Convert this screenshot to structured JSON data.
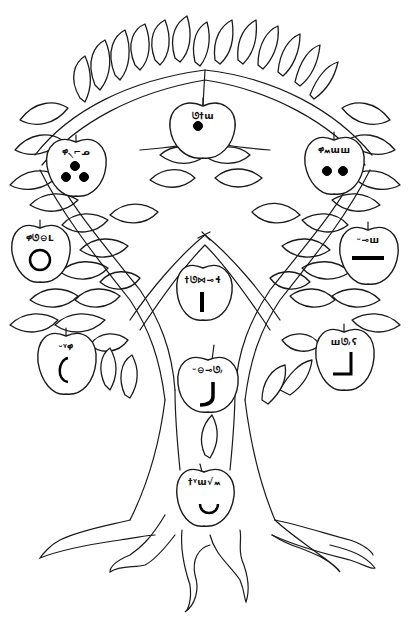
{
  "illustration": {
    "subject": "tree with labeled apples",
    "style": "black line art on white",
    "colors": {
      "line": "#1a1a1a",
      "background": "#ffffff",
      "symbol": "#000000"
    }
  },
  "apples": [
    {
      "id": "top-center",
      "label": "ᘎ†ɯ",
      "symbol": "one-dot"
    },
    {
      "id": "upper-left",
      "label": "ዋ৲⌐ᓄ",
      "symbol": "three-dots"
    },
    {
      "id": "upper-right",
      "label": "ዋ៳ɯш",
      "symbol": "two-dots"
    },
    {
      "id": "mid-left",
      "label": "ዋᘎ⊖ᒪ",
      "symbol": "circle"
    },
    {
      "id": "mid-right",
      "label": "ᵕ⊸ш",
      "symbol": "horizontal-line"
    },
    {
      "id": "center-upper",
      "label": "†ᘎ⋈⊸ɬ",
      "symbol": "vertical-line"
    },
    {
      "id": "lower-left",
      "label": "ᵕᵞዋ",
      "symbol": "left-arc"
    },
    {
      "id": "lower-right",
      "label": "шᘎ៸ʕ",
      "symbol": "corner-line"
    },
    {
      "id": "center-middle",
      "label": "ᵕ⊖⊸ᘎ៸",
      "symbol": "hook"
    },
    {
      "id": "center-lower",
      "label": "†ᵞɯ√៳",
      "symbol": "smile-arc"
    }
  ]
}
